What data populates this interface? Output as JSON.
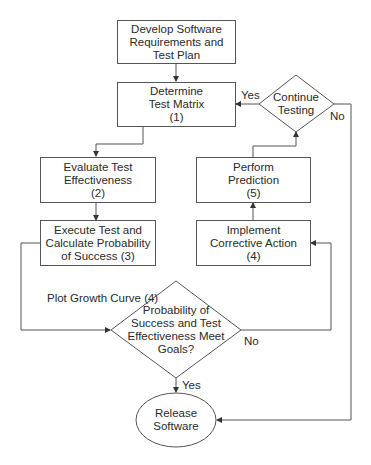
{
  "diagram": {
    "type": "flowchart",
    "nodes": {
      "develop": {
        "shape": "rect",
        "lines": [
          "Develop Software",
          "Requirements and",
          "Test Plan"
        ]
      },
      "determine": {
        "shape": "rect",
        "lines": [
          "Determine",
          "Test Matrix",
          "(1)"
        ]
      },
      "continue": {
        "shape": "diamond",
        "lines": [
          "Continue",
          "Testing"
        ]
      },
      "evaluate": {
        "shape": "rect",
        "lines": [
          "Evaluate Test",
          "Effectiveness",
          "(2)"
        ]
      },
      "perform": {
        "shape": "rect",
        "lines": [
          "Perform",
          "Prediction",
          "(5)"
        ]
      },
      "execute": {
        "shape": "rect",
        "lines": [
          "Execute Test and",
          "Calculate Probability",
          "of Success (3)"
        ]
      },
      "implement": {
        "shape": "rect",
        "lines": [
          "Implement",
          "Corrective Action",
          "(4)"
        ]
      },
      "goals": {
        "shape": "diamond",
        "lines": [
          "Probability of",
          "Success and Test",
          "Effectiveness Meet",
          "Goals?"
        ]
      },
      "release": {
        "shape": "ellipse",
        "lines": [
          "Release",
          "Software"
        ]
      }
    },
    "edge_labels": {
      "continue_yes": "Yes",
      "continue_no": "No",
      "plot_growth": "Plot Growth Curve (4)",
      "goals_no": "No",
      "goals_yes": "Yes"
    },
    "edges": [
      {
        "from": "develop",
        "to": "determine"
      },
      {
        "from": "determine",
        "to": "evaluate"
      },
      {
        "from": "evaluate",
        "to": "execute"
      },
      {
        "from": "execute",
        "to": "goals",
        "label": "Plot Growth Curve (4)"
      },
      {
        "from": "goals",
        "to": "implement",
        "label": "No"
      },
      {
        "from": "goals",
        "to": "release",
        "label": "Yes"
      },
      {
        "from": "implement",
        "to": "perform"
      },
      {
        "from": "perform",
        "to": "continue"
      },
      {
        "from": "continue",
        "to": "determine",
        "label": "Yes"
      },
      {
        "from": "continue",
        "to": "release",
        "label": "No"
      }
    ],
    "colors": {
      "stroke": "#555555",
      "text": "#2a2a2a",
      "background": "#ffffff"
    }
  }
}
